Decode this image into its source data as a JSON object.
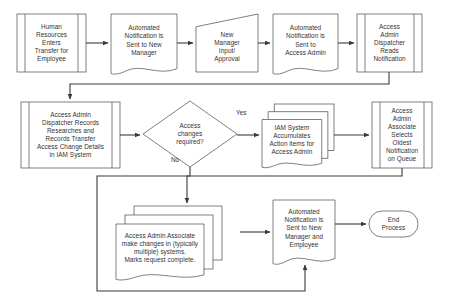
{
  "diagram": {
    "stroke_color": "#555555",
    "connector_color": "#3a3a3a",
    "text_color": "#333333",
    "background": "#ffffff",
    "nodes": [
      {
        "id": "n1",
        "shape": "predefined-process",
        "label": "Human\nResources\nEnters\nTransfer for\nEmployee",
        "x": 17,
        "y": 14,
        "w": 69,
        "h": 58
      },
      {
        "id": "n2",
        "shape": "document",
        "label": "Automated\nNotification is\nSent to New\nManager",
        "x": 111,
        "y": 14,
        "w": 66,
        "h": 58
      },
      {
        "id": "n3",
        "shape": "manual-input",
        "label": "New\nManager\nInput/\nApproval",
        "x": 196,
        "y": 14,
        "w": 62,
        "h": 58
      },
      {
        "id": "n4",
        "shape": "document",
        "label": "Automated\nNotification is\nSent to\nAccess Admin",
        "x": 273,
        "y": 14,
        "w": 65,
        "h": 58
      },
      {
        "id": "n5",
        "shape": "predefined-process",
        "label": "Access\nAdmin\nDispatcher\nReads\nNotification",
        "x": 357,
        "y": 14,
        "w": 65,
        "h": 58
      },
      {
        "id": "n6",
        "shape": "predefined-process",
        "label": "Access Admin\nDispatcher Records\nResearches and\nRecords Transfer\nAccess Change Details\nin IAM System",
        "x": 21,
        "y": 102,
        "w": 99,
        "h": 66
      },
      {
        "id": "n7",
        "shape": "decision",
        "label": "Access\nchanges\nrequired?",
        "x": 143,
        "y": 101,
        "w": 94,
        "h": 66
      },
      {
        "id": "n8",
        "shape": "stacked-document",
        "label": "IAM System\nAccumulates\nAction items for\nAccess Admin",
        "x": 262,
        "y": 104,
        "w": 72,
        "h": 62
      },
      {
        "id": "n9",
        "shape": "predefined-process",
        "label": "Access\nAdmin\nAssociate\nSelects\nOldest\nNotification\non Queue",
        "x": 372,
        "y": 102,
        "w": 60,
        "h": 66
      },
      {
        "id": "n10",
        "shape": "stacked-document",
        "label": "Access Admin Associate\nmake changes in (typically\nmultiple) systems.\nMarks request complete.",
        "x": 116,
        "y": 206,
        "w": 106,
        "h": 72
      },
      {
        "id": "n11",
        "shape": "document",
        "label": "Automated\nNotification is\nSent to New\nManager and\nEmployee",
        "x": 273,
        "y": 200,
        "w": 62,
        "h": 62
      },
      {
        "id": "n12",
        "shape": "terminator",
        "label": "End\nProcess",
        "x": 369,
        "y": 211,
        "w": 49,
        "h": 26
      }
    ],
    "edge_labels": [
      {
        "id": "yes",
        "text": "Yes",
        "x": 236,
        "y": 113
      },
      {
        "id": "no",
        "text": "No",
        "x": 171,
        "y": 160
      }
    ]
  }
}
